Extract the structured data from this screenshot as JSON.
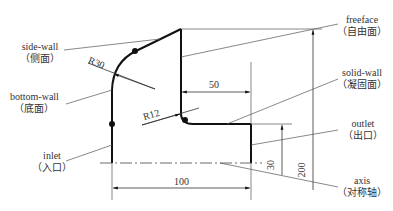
{
  "labels": {
    "side_wall": {
      "en": "side-wall",
      "zh": "（侧面）"
    },
    "bottom_wall": {
      "en": "bottom-wall",
      "zh": "（底面）"
    },
    "inlet": {
      "en": "inlet",
      "zh": "（入口）"
    },
    "freeface": {
      "en": "freeface",
      "zh": "（自由面）"
    },
    "solid_wall": {
      "en": "solid-wall",
      "zh": "（凝固面）"
    },
    "outlet": {
      "en": "outlet",
      "zh": "（出口）"
    },
    "axis": {
      "en": "axis",
      "zh": "（对称轴）"
    }
  },
  "dimensions": {
    "r30": "R30",
    "r12": "R12",
    "d50": "50",
    "d100": "100",
    "d30": "30",
    "d200": "200"
  },
  "colors": {
    "outline": "#111111",
    "leader": "#555555",
    "text": "#333333"
  }
}
